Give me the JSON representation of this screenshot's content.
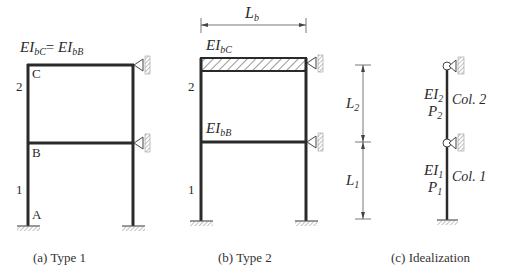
{
  "figure": {
    "panels": [
      {
        "id": "a",
        "caption": "(a) Type 1",
        "beam_label": {
          "prefix_c": "EI",
          "sub_c": "bC",
          "eq": "=",
          "prefix_b": "EI",
          "sub_b": "bB"
        },
        "joint_labels": {
          "top": "C",
          "middle": "B",
          "bottom": "A"
        },
        "story_labels": {
          "upper": "2",
          "lower": "1"
        }
      },
      {
        "id": "b",
        "caption": "(b) Type 2",
        "span_label": {
          "main": "L",
          "sub": "b"
        },
        "top_beam_label": {
          "main": "EI",
          "sub": "bC"
        },
        "mid_beam_label": {
          "main": "EI",
          "sub": "bB"
        },
        "story_labels": {
          "upper": "2",
          "lower": "1"
        }
      },
      {
        "id": "c",
        "caption": "(c) Idealization",
        "dims": {
          "upper": {
            "main": "L",
            "sub": "2"
          },
          "lower": {
            "main": "L",
            "sub": "1"
          }
        },
        "col2": {
          "ei_main": "EI",
          "ei_sub": "2",
          "p_main": "P",
          "p_sub": "2",
          "name": "Col. 2"
        },
        "col1": {
          "ei_main": "EI",
          "ei_sub": "1",
          "p_main": "P",
          "p_sub": "1",
          "name": "Col. 1"
        }
      }
    ],
    "colors": {
      "line": "#2a2a2a",
      "hatch": "#555555",
      "support": "#777777"
    }
  }
}
